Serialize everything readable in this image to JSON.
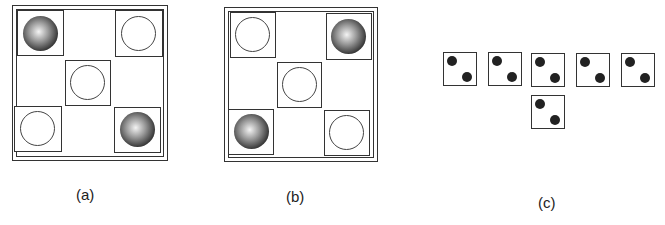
{
  "figure": {
    "panels": [
      {
        "id": "a",
        "label": "(a)",
        "cells": [
          {
            "position": "top-left",
            "ball": "shaded"
          },
          {
            "position": "top-right",
            "ball": "open"
          },
          {
            "position": "center",
            "ball": "open"
          },
          {
            "position": "bottom-left",
            "ball": "open"
          },
          {
            "position": "bottom-right",
            "ball": "shaded"
          }
        ]
      },
      {
        "id": "b",
        "label": "(b)",
        "cells": [
          {
            "position": "top-left",
            "ball": "open"
          },
          {
            "position": "top-right",
            "ball": "shaded"
          },
          {
            "position": "center",
            "ball": "open"
          },
          {
            "position": "bottom-left",
            "ball": "shaded"
          },
          {
            "position": "bottom-right",
            "ball": "open"
          }
        ]
      },
      {
        "id": "c",
        "label": "(c)",
        "dice": [
          {
            "row": 1,
            "pips": 2
          },
          {
            "row": 1,
            "pips": 2
          },
          {
            "row": 1,
            "pips": 2
          },
          {
            "row": 1,
            "pips": 2
          },
          {
            "row": 1,
            "pips": 2
          },
          {
            "row": 2,
            "pips": 2
          }
        ]
      }
    ]
  }
}
